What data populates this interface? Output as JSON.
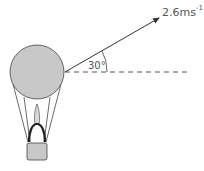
{
  "diagram": {
    "velocity_label": "2.6ms",
    "velocity_unit_exponent": "-1",
    "angle_label": "30°",
    "colors": {
      "balloon_fill": "#c8c8c8",
      "outline": "#444444",
      "dash": "#555555",
      "text": "#555555"
    }
  }
}
